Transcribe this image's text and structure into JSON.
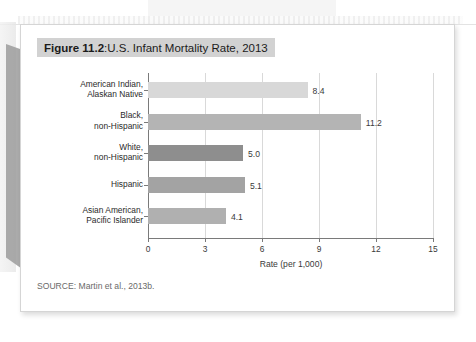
{
  "figure": {
    "number_label": "Figure 11.2",
    "title_separator": ": ",
    "title_text": "U.S. Infant Mortality Rate, 2013",
    "source": "SOURCE: Martin et al., 2013b.",
    "title_band_color": "#d2d2d2"
  },
  "chart_data": {
    "type": "bar",
    "orientation": "horizontal",
    "title": "U.S. Infant Mortality Rate, 2013",
    "categories": [
      "American Indian, Alaskan Native",
      "Black, non-Hispanic",
      "White, non-Hispanic",
      "Hispanic",
      "Asian American, Pacific Islander"
    ],
    "category_lines": [
      [
        "American Indian,",
        "Alaskan Native"
      ],
      [
        "Black,",
        "non-Hispanic"
      ],
      [
        "White,",
        "non-Hispanic"
      ],
      [
        "Hispanic"
      ],
      [
        "Asian American,",
        "Pacific Islander"
      ]
    ],
    "values": [
      8.4,
      11.2,
      5.0,
      5.1,
      4.1
    ],
    "value_labels": [
      "8.4",
      "11.2",
      "5.0",
      "5.1",
      "4.1"
    ],
    "bar_colors": [
      "#d8d8d8",
      "#b4b4b4",
      "#8e8e8e",
      "#a3a3a3",
      "#b0b0b0"
    ],
    "xlabel": "Rate (per 1,000)",
    "ylabel": "",
    "xlim": [
      0,
      15
    ],
    "xticks": [
      0,
      3,
      6,
      9,
      12,
      15
    ],
    "xtick_labels": [
      "0",
      "3",
      "6",
      "9",
      "12",
      "15"
    ],
    "grid": true,
    "legend": false
  }
}
